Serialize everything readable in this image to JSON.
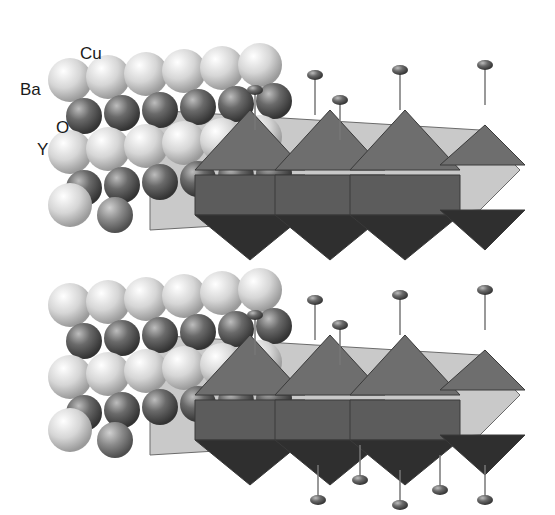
{
  "figure": {
    "labels": [
      {
        "id": "cu",
        "text": "Cu",
        "x": 80,
        "y": 44
      },
      {
        "id": "ba",
        "text": "Ba",
        "x": 22,
        "y": 86
      },
      {
        "id": "o",
        "text": "O",
        "x": 56,
        "y": 124
      },
      {
        "id": "y",
        "text": "Y",
        "x": 37,
        "y": 145
      }
    ],
    "colors": {
      "ba_atom": "#d9d9d9",
      "cu_atom": "#555555",
      "o_atom": "#6a6a6a",
      "y_atom": "#4a4a4a",
      "polyhedron_top": "#7a7a7a",
      "polyhedron_bottom": "#2e2e2e",
      "plane": "#b3b3b3",
      "background": "#ffffff"
    },
    "layers": 2
  }
}
